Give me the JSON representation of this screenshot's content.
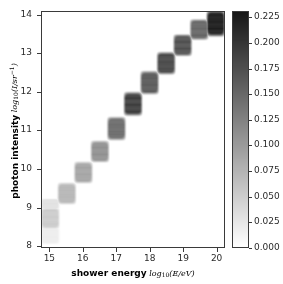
{
  "figure": {
    "width": 283,
    "height": 284,
    "background": "#ffffff"
  },
  "axes": {
    "frame_color": "#3a3a3a",
    "x_label_bold": "shower energy",
    "x_label_math_prefix": "log",
    "x_label_math_sub": "10",
    "x_label_math_suffix": "(E/eV)",
    "y_label_bold": "photon intensity",
    "y_label_math_prefix": "log",
    "y_label_math_sub": "10",
    "y_label_math_mid": "(I/sr",
    "y_label_math_sup": "−1",
    "y_label_math_end": ")"
  },
  "colorbar": {
    "label": "",
    "low_color": "#ffffff",
    "high_color": "#1f1f1f",
    "ticks": [
      0.0,
      0.025,
      0.05,
      0.075,
      0.1,
      0.125,
      0.15,
      0.175,
      0.2,
      0.225
    ],
    "tick_labels": [
      "0.000",
      "0.025",
      "0.050",
      "0.075",
      "0.100",
      "0.125",
      "0.150",
      "0.175",
      "0.200",
      "0.225"
    ],
    "vmin": 0.0,
    "vmax": 0.2312
  },
  "chart_data": {
    "type": "heatmap",
    "title": "",
    "xlabel": "shower energy log10(E/eV)",
    "ylabel": "photon intensity log10(I/sr^-1)",
    "xlim": [
      14.75,
      20.25
    ],
    "ylim": [
      7.95,
      14.1
    ],
    "grid": false,
    "legend_position": "right-colorbar",
    "colormap": "grayscale_reversed",
    "cbar_range": [
      0.0,
      0.2312
    ],
    "x_ticks": [
      15,
      16,
      17,
      18,
      19,
      20
    ],
    "x_tick_labels": [
      "15",
      "16",
      "17",
      "18",
      "19",
      "20"
    ],
    "y_ticks": [
      8,
      9,
      10,
      11,
      12,
      13,
      14
    ],
    "y_tick_labels": [
      "8",
      "9",
      "10",
      "11",
      "12",
      "13",
      "14"
    ],
    "x_bin_edges": [
      14.75,
      15.25,
      15.75,
      16.25,
      16.75,
      17.25,
      17.75,
      18.25,
      18.75,
      19.25,
      19.75,
      20.25
    ],
    "y_bin_edges": [
      7.95,
      8.45,
      8.95,
      9.45,
      9.95,
      10.45,
      10.95,
      11.45,
      11.95,
      12.45,
      12.95,
      13.45,
      13.95,
      14.1
    ],
    "blocks": [
      {
        "x_center": 15.0,
        "y_center": 8.7,
        "x0": 14.75,
        "x1": 15.25,
        "y0": 8.45,
        "y1": 8.95,
        "value": 0.052
      },
      {
        "x_center": 15.0,
        "y_center": 9.05,
        "x0": 14.75,
        "x1": 15.25,
        "y0": 8.95,
        "y1": 9.2,
        "value": 0.03
      },
      {
        "x_center": 15.0,
        "y_center": 8.3,
        "x0": 14.75,
        "x1": 15.25,
        "y0": 8.05,
        "y1": 8.45,
        "value": 0.018
      },
      {
        "x_center": 15.5,
        "y_center": 9.35,
        "x0": 15.25,
        "x1": 15.75,
        "y0": 9.1,
        "y1": 9.6,
        "value": 0.074
      },
      {
        "x_center": 16.0,
        "y_center": 9.9,
        "x0": 15.75,
        "x1": 16.25,
        "y0": 9.65,
        "y1": 10.15,
        "value": 0.092
      },
      {
        "x_center": 16.5,
        "y_center": 10.45,
        "x0": 16.25,
        "x1": 16.75,
        "y0": 10.2,
        "y1": 10.7,
        "value": 0.112
      },
      {
        "x_center": 17.0,
        "y_center": 11.05,
        "x0": 16.75,
        "x1": 17.25,
        "y0": 10.78,
        "y1": 11.32,
        "value": 0.15
      },
      {
        "x_center": 17.5,
        "y_center": 11.7,
        "x0": 17.25,
        "x1": 17.75,
        "y0": 11.42,
        "y1": 11.97,
        "value": 0.196
      },
      {
        "x_center": 18.0,
        "y_center": 12.25,
        "x0": 17.75,
        "x1": 18.25,
        "y0": 11.98,
        "y1": 12.52,
        "value": 0.168
      },
      {
        "x_center": 18.5,
        "y_center": 12.75,
        "x0": 18.25,
        "x1": 18.75,
        "y0": 12.5,
        "y1": 13.02,
        "value": 0.186
      },
      {
        "x_center": 19.0,
        "y_center": 13.22,
        "x0": 18.75,
        "x1": 19.25,
        "y0": 12.98,
        "y1": 13.48,
        "value": 0.178
      },
      {
        "x_center": 19.5,
        "y_center": 13.62,
        "x0": 19.25,
        "x1": 19.75,
        "y0": 13.4,
        "y1": 13.88,
        "value": 0.156
      },
      {
        "x_center": 20.0,
        "y_center": 13.78,
        "x0": 19.75,
        "x1": 20.25,
        "y0": 13.5,
        "y1": 14.1,
        "value": 0.231
      }
    ]
  }
}
